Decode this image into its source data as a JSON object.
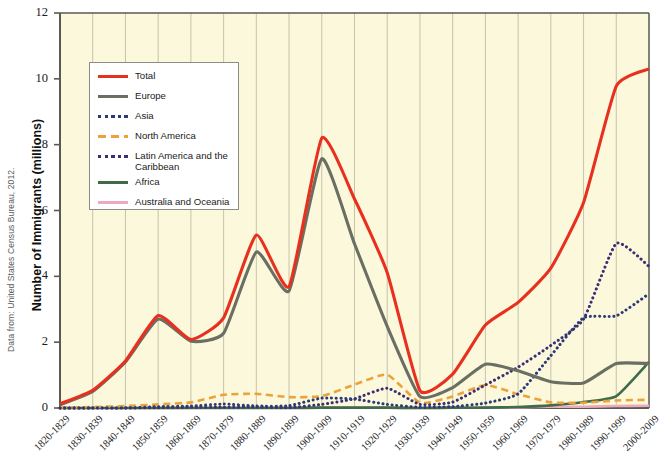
{
  "source_note": "Data from: United States Census Bureau, 2012.",
  "axis": {
    "y_title": "Number of Immigrants (millions)",
    "y_ticks": [
      "0",
      "2",
      "4",
      "6",
      "8",
      "10",
      "12"
    ]
  },
  "legend": {
    "entries": [
      {
        "label": "Total",
        "color": "#e8301f",
        "style": "solid"
      },
      {
        "label": "Europe",
        "color": "#6b6e62",
        "style": "solid"
      },
      {
        "label": "Asia",
        "color": "#2b3a77",
        "style": "dotted"
      },
      {
        "label": "North America",
        "color": "#eba23a",
        "style": "dashed"
      },
      {
        "label": "Latin America and the Caribbean",
        "color": "#3b2f73",
        "style": "dotted"
      },
      {
        "label": "Africa",
        "color": "#3f6b4b",
        "style": "solid"
      },
      {
        "label": "Australia and Oceania",
        "color": "#edaabc",
        "style": "solid"
      }
    ]
  },
  "colors": {
    "plot_background": "#fbf8dc",
    "gridline": "#b9b69e",
    "axis": "#5a5a52",
    "legend_border": "#8d8d86",
    "text": "#1a1a1a"
  },
  "chart_data": {
    "type": "line",
    "title": "",
    "xlabel": "",
    "ylabel": "Number of Immigrants (millions)",
    "ylim": [
      0,
      12
    ],
    "grid": true,
    "legend_position": "upper-left-inside",
    "categories": [
      "1820-1829",
      "1830-1839",
      "1840-1849",
      "1850-1859",
      "1860-1869",
      "1870-1879",
      "1880-1889",
      "1890-1899",
      "1900-1909",
      "1910-1919",
      "1920-1929",
      "1930-1939",
      "1940-1949",
      "1950-1959",
      "1960-1969",
      "1970-1979",
      "1980-1989",
      "1990-1999",
      "2000-2009"
    ],
    "series": [
      {
        "name": "Total",
        "color": "#e8301f",
        "style": "solid",
        "values": [
          0.13,
          0.54,
          1.43,
          2.81,
          2.08,
          2.74,
          5.25,
          3.69,
          8.2,
          6.35,
          4.11,
          0.53,
          1.03,
          2.52,
          3.21,
          4.25,
          6.24,
          9.78,
          10.3
        ]
      },
      {
        "name": "Europe",
        "color": "#6b6e62",
        "style": "solid",
        "values": [
          0.1,
          0.5,
          1.4,
          2.7,
          2.03,
          2.27,
          4.74,
          3.56,
          7.57,
          4.99,
          2.48,
          0.35,
          0.62,
          1.33,
          1.13,
          0.8,
          0.76,
          1.35,
          1.35
        ]
      },
      {
        "name": "Asia",
        "color": "#2b3a77",
        "style": "dotted",
        "values": [
          0.0,
          0.0,
          0.0,
          0.04,
          0.06,
          0.12,
          0.06,
          0.07,
          0.3,
          0.27,
          0.11,
          0.02,
          0.04,
          0.15,
          0.43,
          1.59,
          2.74,
          2.8,
          3.47
        ]
      },
      {
        "name": "North America",
        "color": "#eba23a",
        "style": "dashed",
        "values": [
          0.01,
          0.03,
          0.06,
          0.11,
          0.17,
          0.4,
          0.43,
          0.33,
          0.36,
          0.71,
          1.01,
          0.16,
          0.35,
          0.7,
          0.42,
          0.17,
          0.16,
          0.23,
          0.25
        ]
      },
      {
        "name": "Latin America and the Caribbean",
        "color": "#3b2f73",
        "style": "dotted",
        "values": [
          0.0,
          0.0,
          0.0,
          0.01,
          0.02,
          0.02,
          0.03,
          0.01,
          0.11,
          0.28,
          0.6,
          0.11,
          0.18,
          0.7,
          1.24,
          1.9,
          2.7,
          5.0,
          4.3
        ]
      },
      {
        "name": "Africa",
        "color": "#3f6b4b",
        "style": "solid",
        "values": [
          0.0,
          0.0,
          0.0,
          0.0,
          0.0,
          0.0,
          0.0,
          0.0,
          0.01,
          0.01,
          0.01,
          0.0,
          0.01,
          0.01,
          0.03,
          0.08,
          0.18,
          0.36,
          1.4
        ]
      },
      {
        "name": "Australia and Oceania",
        "color": "#edaabc",
        "style": "solid",
        "values": [
          0.0,
          0.0,
          0.0,
          0.0,
          0.01,
          0.01,
          0.01,
          0.01,
          0.01,
          0.01,
          0.01,
          0.0,
          0.01,
          0.01,
          0.02,
          0.04,
          0.04,
          0.06,
          0.07
        ]
      }
    ]
  }
}
